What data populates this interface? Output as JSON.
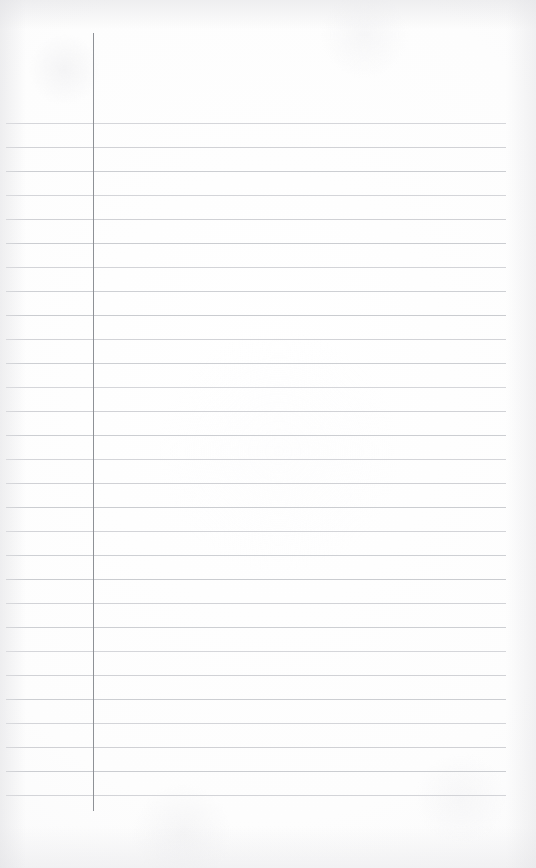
{
  "document": {
    "type": "lined-notebook-page",
    "title": "Blank ruled notebook page",
    "content_text": "",
    "is_blank": true,
    "page_width": 536,
    "page_height": 868,
    "background_color": "#fdfdfd",
    "paper_tone": "off-white"
  },
  "ruling": {
    "rule_color": "#c9cbcf",
    "rule_thickness": 1,
    "rule_spacing": 24,
    "rule_count": 29,
    "first_rule_y": 123,
    "last_rule_y": 797,
    "rule_left_x": 6,
    "rule_right_x": 506,
    "rule_length": 500
  },
  "margin_rule": {
    "label": "left margin rule",
    "color": "#8e9196",
    "thickness": 1,
    "x": 93,
    "top_y": 33,
    "bottom_y": 811,
    "height": 778
  },
  "regions": {
    "header_area_label": "header area above first rule",
    "margin_column_label": "left margin column",
    "writing_area_label": "writing area",
    "footer_area_label": "footer area below last rule"
  }
}
